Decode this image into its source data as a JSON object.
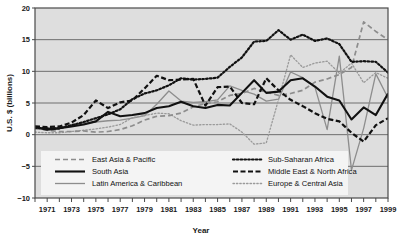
{
  "chart_data": {
    "type": "line",
    "title": "",
    "xlabel": "Year",
    "ylabel": "U.S. $ (billions)",
    "xlim": [
      1970,
      1999
    ],
    "ylim": [
      -10,
      20
    ],
    "yticks": [
      -10,
      -5,
      0,
      5,
      10,
      15,
      20
    ],
    "ytick_labels": [
      "−10",
      "−5",
      "0",
      "5",
      "10",
      "15",
      "20"
    ],
    "xticks": [
      1970,
      1971,
      1972,
      1973,
      1974,
      1975,
      1976,
      1977,
      1978,
      1979,
      1980,
      1981,
      1982,
      1983,
      1984,
      1985,
      1986,
      1987,
      1988,
      1989,
      1990,
      1991,
      1992,
      1993,
      1994,
      1995,
      1996,
      1997,
      1998,
      1999
    ],
    "xtick_labels_shown": [
      "1971",
      "1973",
      "1975",
      "1977",
      "1979",
      "1981",
      "1983",
      "1985",
      "1987",
      "1989",
      "1991",
      "1993",
      "1995",
      "1997",
      "1999"
    ],
    "grid": "horizontal",
    "legend_position": "inside-bottom",
    "x": [
      1970,
      1971,
      1972,
      1973,
      1974,
      1975,
      1976,
      1977,
      1978,
      1979,
      1980,
      1981,
      1982,
      1983,
      1984,
      1985,
      1986,
      1987,
      1988,
      1989,
      1990,
      1991,
      1992,
      1993,
      1994,
      1995,
      1996,
      1997,
      1998,
      1999
    ],
    "series": [
      {
        "name": "East Asia & Pacific",
        "style": "dashed",
        "color": "#8d8d8d",
        "values": [
          1.0,
          0.7,
          0.5,
          0.5,
          0.6,
          0.4,
          0.5,
          0.8,
          1.4,
          2.3,
          2.9,
          3.0,
          3.4,
          4.4,
          4.9,
          5.2,
          6.2,
          6.5,
          7.3,
          6.7,
          6.2,
          6.5,
          7.0,
          8.3,
          8.8,
          9.5,
          10.6,
          17.8,
          16.3,
          15.0
        ]
      },
      {
        "name": "South Asia",
        "style": "solid-thick",
        "color": "#111111",
        "values": [
          1.2,
          0.8,
          1.0,
          1.3,
          1.6,
          2.1,
          3.6,
          2.9,
          3.1,
          3.4,
          4.2,
          4.5,
          5.2,
          4.5,
          4.2,
          4.7,
          4.6,
          6.6,
          8.6,
          6.6,
          6.8,
          8.6,
          8.9,
          7.6,
          6.0,
          5.4,
          2.4,
          4.3,
          3.1,
          6.5
        ]
      },
      {
        "name": "Latin America & Caribbean",
        "style": "solid-thin",
        "color": "#8d8d8d",
        "values": [
          0.9,
          0.9,
          1.1,
          1.5,
          1.8,
          2.0,
          2.2,
          2.3,
          2.6,
          3.0,
          4.8,
          6.9,
          5.3,
          5.1,
          5.2,
          5.5,
          7.7,
          7.0,
          6.4,
          5.3,
          5.6,
          9.9,
          9.0,
          7.5,
          0.8,
          12.4,
          -5.6,
          1.0,
          9.6,
          5.8
        ]
      },
      {
        "name": "Sub-Saharan Africa",
        "style": "dotted-thick",
        "color": "#111111",
        "values": [
          1.1,
          1.0,
          1.0,
          1.5,
          2.0,
          2.6,
          3.2,
          4.0,
          5.6,
          6.5,
          7.0,
          7.8,
          8.9,
          8.7,
          8.8,
          9.0,
          10.7,
          12.2,
          14.7,
          14.8,
          16.5,
          15.0,
          15.8,
          14.8,
          15.2,
          14.3,
          11.5,
          11.6,
          11.5,
          9.8
        ]
      },
      {
        "name": "Middle East & North Africa",
        "style": "dashed-thick",
        "color": "#111111",
        "values": [
          1.3,
          1.2,
          1.3,
          1.9,
          3.1,
          5.4,
          4.2,
          5.1,
          5.4,
          7.3,
          9.3,
          8.6,
          8.7,
          8.8,
          4.6,
          7.5,
          7.6,
          5.0,
          4.8,
          8.9,
          7.0,
          5.5,
          4.5,
          3.4,
          2.5,
          2.1,
          0.3,
          -1.1,
          1.5,
          2.6
        ]
      },
      {
        "name": "Europe & Central Asia",
        "style": "dotted-thin",
        "color": "#9a9a9a",
        "values": [
          0.4,
          0.3,
          0.3,
          0.5,
          0.7,
          0.9,
          1.2,
          1.6,
          2.7,
          3.0,
          3.4,
          3.3,
          2.2,
          1.5,
          1.6,
          1.6,
          1.7,
          0.4,
          -1.5,
          -1.3,
          5.5,
          12.6,
          10.6,
          11.3,
          11.6,
          9.7,
          11.3,
          8.2,
          9.8,
          8.9
        ]
      }
    ]
  },
  "legend": {
    "items": [
      {
        "label": "East Asia & Pacific",
        "style": "dashed",
        "color": "#8d8d8d"
      },
      {
        "label": "South Asia",
        "style": "solid-thick",
        "color": "#111111"
      },
      {
        "label": "Latin America & Caribbean",
        "style": "solid-thin",
        "color": "#8d8d8d"
      },
      {
        "label": "Sub-Saharan Africa",
        "style": "dotted-thick",
        "color": "#111111"
      },
      {
        "label": "Middle East & North Africa",
        "style": "dashed-thick",
        "color": "#111111"
      },
      {
        "label": "Europe & Central Asia",
        "style": "dotted-thin",
        "color": "#9a9a9a"
      }
    ]
  },
  "colors": {
    "plot_background": "#dedede",
    "grid": "#6e6e6e",
    "frame": "#4a4a4a",
    "legend_background": "#f4f4f4",
    "page_background": "#ffffff"
  }
}
